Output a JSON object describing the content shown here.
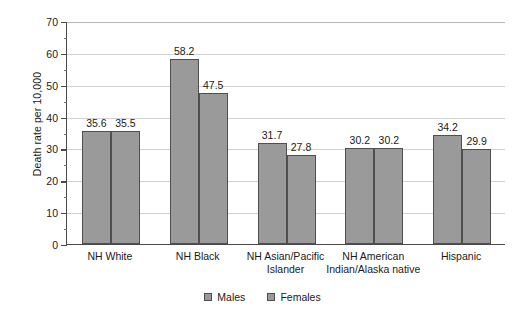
{
  "chart_data": {
    "type": "bar",
    "title": "",
    "xlabel": "",
    "ylabel": "Death rate per 10,000",
    "ylim": [
      0,
      70
    ],
    "ytick_step": 10,
    "yminor_step": 5,
    "grid": true,
    "legend_position": "bottom",
    "categories": [
      "NH White",
      "NH Black",
      "NH Asian/Pacific\nIslander",
      "NH American\nIndian/Alaska native",
      "Hispanic"
    ],
    "yticks": [
      "0",
      "10",
      "20",
      "30",
      "40",
      "50",
      "60",
      "70"
    ],
    "series": [
      {
        "name": "Males",
        "values": [
          35.6,
          58.2,
          31.7,
          30.2,
          34.2
        ]
      },
      {
        "name": "Females",
        "values": [
          35.5,
          47.5,
          27.8,
          30.2,
          29.9
        ]
      }
    ],
    "data_labels": [
      [
        "35.6",
        "35.5"
      ],
      [
        "58.2",
        "47.5"
      ],
      [
        "31.7",
        "27.8"
      ],
      [
        "30.2",
        "30.2"
      ],
      [
        "34.2",
        "29.9"
      ]
    ],
    "colors": {
      "bar_fill": "#9a9a9a",
      "bar_border": "#4f4f4f",
      "axis": "#4a4a4a",
      "gridline": "#d2d2d2",
      "text": "#1a1a1a",
      "background": "#ffffff"
    }
  }
}
